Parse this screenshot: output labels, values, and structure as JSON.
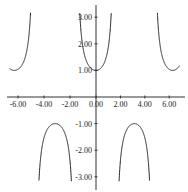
{
  "chart_data": {
    "type": "line",
    "title": "",
    "function": "sec(x)",
    "xlabel": "",
    "ylabel": "",
    "xlim": [
      -6.8,
      7.0
    ],
    "ylim": [
      -3.4,
      3.5
    ],
    "grid": false,
    "legend": null,
    "x_ticks": [
      -6,
      -4,
      -2,
      0,
      2,
      4,
      6
    ],
    "x_tick_labels": [
      "-6.00",
      "-4.00",
      "-2.00",
      "0.00",
      "2.00",
      "4.00",
      "6.00"
    ],
    "y_ticks": [
      3,
      2,
      1,
      -1,
      -2,
      -3
    ],
    "y_tick_labels": [
      "3.00",
      "2.00",
      "1.00",
      "-1.00",
      "-2.00",
      "-3.00"
    ],
    "series": [
      {
        "name": "sec(x)",
        "branches": [
          {
            "x": [
              -6.6,
              -6.28,
              -6.0,
              -5.5,
              -5.0
            ],
            "y": [
              1.05,
              1.0,
              1.04,
              1.41,
              3.2
            ]
          },
          {
            "x": [
              -4.5,
              -4.0,
              -3.5,
              -3.14,
              -2.5,
              -2.0,
              -1.9
            ],
            "y": [
              -4.7,
              -1.53,
              -1.07,
              -1.0,
              -1.25,
              -2.4,
              -3.1
            ]
          },
          {
            "x": [
              -1.25,
              -1.0,
              -0.5,
              0.0,
              0.5,
              1.0,
              1.25
            ],
            "y": [
              3.17,
              1.85,
              1.14,
              1.0,
              1.14,
              1.85,
              3.17
            ]
          },
          {
            "x": [
              1.9,
              2.0,
              2.5,
              3.14,
              3.5,
              4.0,
              4.5
            ],
            "y": [
              -3.1,
              -2.4,
              -1.25,
              -1.0,
              -1.07,
              -1.53,
              -4.7
            ]
          },
          {
            "x": [
              5.0,
              5.5,
              6.0,
              6.28,
              6.6
            ],
            "y": [
              3.2,
              1.41,
              1.04,
              1.0,
              1.05
            ]
          }
        ]
      }
    ]
  }
}
